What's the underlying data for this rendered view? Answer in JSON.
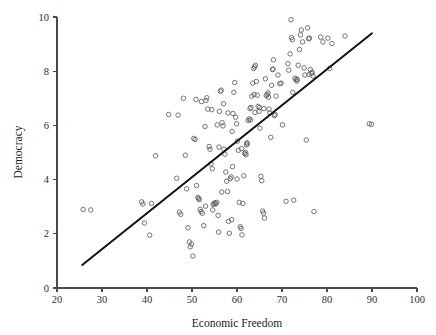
{
  "chart_data": {
    "type": "scatter",
    "title": "",
    "xlabel": "Economic Freedom",
    "ylabel": "Democracy",
    "xlim": [
      20,
      100
    ],
    "ylim": [
      0,
      10
    ],
    "xticks": [
      20,
      30,
      40,
      50,
      60,
      70,
      80,
      90,
      100
    ],
    "yticks": [
      0,
      2,
      4,
      6,
      8,
      10
    ],
    "xtick_labels": [
      "20",
      "30",
      "40",
      "50",
      "60",
      "70",
      "80",
      "90",
      "100"
    ],
    "ytick_labels": [
      "0",
      "2",
      "4",
      "6",
      "8",
      "10"
    ],
    "grid": false,
    "legend": null,
    "marker": "open-circle",
    "marker_color": "#5c5c63",
    "line_color": "#111111",
    "trendline": {
      "type": "linear",
      "x_start": 25.6,
      "y_start": 0.85,
      "x_end": 90.0,
      "y_end": 9.4,
      "slope": 0.1328,
      "intercept": -2.55
    },
    "points": [
      [
        25.8,
        2.9
      ],
      [
        27.5,
        2.88
      ],
      [
        38.8,
        3.18
      ],
      [
        39.1,
        3.1
      ],
      [
        39.4,
        2.4
      ],
      [
        40.6,
        1.95
      ],
      [
        41.0,
        3.12
      ],
      [
        41.9,
        4.88
      ],
      [
        46.6,
        4.05
      ],
      [
        46.9,
        6.38
      ],
      [
        47.2,
        2.8
      ],
      [
        47.5,
        2.72
      ],
      [
        48.1,
        7.0
      ],
      [
        48.5,
        4.9
      ],
      [
        48.8,
        3.66
      ],
      [
        49.1,
        2.22
      ],
      [
        49.4,
        1.7
      ],
      [
        49.6,
        1.52
      ],
      [
        49.9,
        1.62
      ],
      [
        50.2,
        1.18
      ],
      [
        50.4,
        5.52
      ],
      [
        50.7,
        5.48
      ],
      [
        51.0,
        3.78
      ],
      [
        51.3,
        3.34
      ],
      [
        51.5,
        3.3
      ],
      [
        51.8,
        2.9
      ],
      [
        52.0,
        2.82
      ],
      [
        52.3,
        2.76
      ],
      [
        52.6,
        2.3
      ],
      [
        52.9,
        5.96
      ],
      [
        53.1,
        6.92
      ],
      [
        53.3,
        7.02
      ],
      [
        53.5,
        6.6
      ],
      [
        53.8,
        5.22
      ],
      [
        54.0,
        5.12
      ],
      [
        54.2,
        4.58
      ],
      [
        54.5,
        4.4
      ],
      [
        54.7,
        3.08
      ],
      [
        54.9,
        3.12
      ],
      [
        55.1,
        3.14
      ],
      [
        55.3,
        3.1
      ],
      [
        55.5,
        3.16
      ],
      [
        55.8,
        2.68
      ],
      [
        55.9,
        2.06
      ],
      [
        56.1,
        6.52
      ],
      [
        56.3,
        7.26
      ],
      [
        56.5,
        7.3
      ],
      [
        56.7,
        6.1
      ],
      [
        56.9,
        5.98
      ],
      [
        57.1,
        5.12
      ],
      [
        57.3,
        4.94
      ],
      [
        57.5,
        4.28
      ],
      [
        57.7,
        3.94
      ],
      [
        57.9,
        3.56
      ],
      [
        58.1,
        2.46
      ],
      [
        58.3,
        2.02
      ],
      [
        58.5,
        4.04
      ],
      [
        58.7,
        4.1
      ],
      [
        58.9,
        5.78
      ],
      [
        59.1,
        6.44
      ],
      [
        59.3,
        7.22
      ],
      [
        59.5,
        7.58
      ],
      [
        59.7,
        6.3
      ],
      [
        59.9,
        6.06
      ],
      [
        60.1,
        5.42
      ],
      [
        60.3,
        5.08
      ],
      [
        60.5,
        3.16
      ],
      [
        60.7,
        2.26
      ],
      [
        60.9,
        2.2
      ],
      [
        61.1,
        1.96
      ],
      [
        61.3,
        3.12
      ],
      [
        61.5,
        4.14
      ],
      [
        61.7,
        4.96
      ],
      [
        61.9,
        5.0
      ],
      [
        62.1,
        5.28
      ],
      [
        62.3,
        5.32
      ],
      [
        62.5,
        6.18
      ],
      [
        62.7,
        6.24
      ],
      [
        62.9,
        6.62
      ],
      [
        63.1,
        6.66
      ],
      [
        63.3,
        7.08
      ],
      [
        63.5,
        7.56
      ],
      [
        63.7,
        8.1
      ],
      [
        63.9,
        8.16
      ],
      [
        64.1,
        8.22
      ],
      [
        64.3,
        7.62
      ],
      [
        64.5,
        7.12
      ],
      [
        64.7,
        6.7
      ],
      [
        64.9,
        6.52
      ],
      [
        65.1,
        5.9
      ],
      [
        65.3,
        4.12
      ],
      [
        65.5,
        3.96
      ],
      [
        65.7,
        2.84
      ],
      [
        65.9,
        2.76
      ],
      [
        66.1,
        2.58
      ],
      [
        66.3,
        7.72
      ],
      [
        66.5,
        7.1
      ],
      [
        66.7,
        7.14
      ],
      [
        66.9,
        7.2
      ],
      [
        67.1,
        6.6
      ],
      [
        67.3,
        6.46
      ],
      [
        67.5,
        5.56
      ],
      [
        67.7,
        7.48
      ],
      [
        67.9,
        8.06
      ],
      [
        68.1,
        8.42
      ],
      [
        68.3,
        6.36
      ],
      [
        68.5,
        6.4
      ],
      [
        68.7,
        7.08
      ],
      [
        69.1,
        7.86
      ],
      [
        69.5,
        7.54
      ],
      [
        70.1,
        6.02
      ],
      [
        70.9,
        3.2
      ],
      [
        71.3,
        8.28
      ],
      [
        71.5,
        8.04
      ],
      [
        71.8,
        8.64
      ],
      [
        72.0,
        9.9
      ],
      [
        72.1,
        9.24
      ],
      [
        72.3,
        9.16
      ],
      [
        72.4,
        7.22
      ],
      [
        72.6,
        3.24
      ],
      [
        72.9,
        7.74
      ],
      [
        73.1,
        7.68
      ],
      [
        73.3,
        7.64
      ],
      [
        73.6,
        8.22
      ],
      [
        73.9,
        8.8
      ],
      [
        74.1,
        9.34
      ],
      [
        74.3,
        9.52
      ],
      [
        74.6,
        9.08
      ],
      [
        74.9,
        8.12
      ],
      [
        75.1,
        7.86
      ],
      [
        75.4,
        5.46
      ],
      [
        75.7,
        9.6
      ],
      [
        75.9,
        9.2
      ],
      [
        76.1,
        9.22
      ],
      [
        76.3,
        8.06
      ],
      [
        76.5,
        7.92
      ],
      [
        76.7,
        7.96
      ],
      [
        76.9,
        7.82
      ],
      [
        77.1,
        2.82
      ],
      [
        78.6,
        9.26
      ],
      [
        79.1,
        9.08
      ],
      [
        80.2,
        9.22
      ],
      [
        80.6,
        8.1
      ],
      [
        81.1,
        9.02
      ],
      [
        84.0,
        9.3
      ],
      [
        89.4,
        6.06
      ],
      [
        89.9,
        6.04
      ],
      [
        44.8,
        6.4
      ],
      [
        50.9,
        6.96
      ],
      [
        52.1,
        6.88
      ],
      [
        54.4,
        6.58
      ],
      [
        55.6,
        6.02
      ],
      [
        56.0,
        5.2
      ],
      [
        57.0,
        6.8
      ],
      [
        58.0,
        6.46
      ],
      [
        59.0,
        4.48
      ],
      [
        60.0,
        4.02
      ],
      [
        61.0,
        5.14
      ],
      [
        62.0,
        4.92
      ],
      [
        63.0,
        6.2
      ],
      [
        64.0,
        6.48
      ],
      [
        65.0,
        6.66
      ],
      [
        66.0,
        6.62
      ],
      [
        67.0,
        7.04
      ],
      [
        68.0,
        8.08
      ],
      [
        53.0,
        3.02
      ],
      [
        54.6,
        2.88
      ],
      [
        56.6,
        3.54
      ],
      [
        51.6,
        3.26
      ],
      [
        58.8,
        2.52
      ],
      [
        62.2,
        5.36
      ],
      [
        63.8,
        7.14
      ],
      [
        69.8,
        7.56
      ],
      [
        73.4,
        7.7
      ],
      [
        76.0,
        7.88
      ]
    ]
  },
  "axes": {
    "x_title": "Economic Freedom",
    "y_title": "Democracy"
  }
}
